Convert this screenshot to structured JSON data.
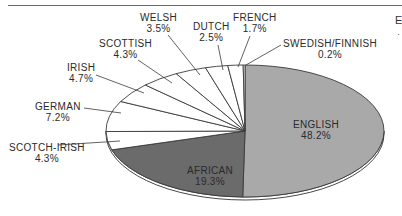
{
  "chart_data": {
    "type": "pie",
    "style": "3d-tilted",
    "title": "",
    "start_angle": "12 o'clock",
    "direction": "clockwise",
    "slices": [
      {
        "label": "ENGLISH",
        "value": 48.2,
        "display": "48.2%",
        "color": "#a9a9a9",
        "label_position": "inside"
      },
      {
        "label": "AFRICAN",
        "value": 19.3,
        "display": "19.3%",
        "color": "#6b6b6b",
        "label_position": "inside"
      },
      {
        "label": "SCOTCH-IRISH",
        "value": 4.3,
        "display": "4.3%",
        "color": "#ffffff",
        "label_position": "outside"
      },
      {
        "label": "GERMAN",
        "value": 7.2,
        "display": "7.2%",
        "color": "#ffffff",
        "label_position": "outside"
      },
      {
        "label": "IRISH",
        "value": 4.7,
        "display": "4.7%",
        "color": "#ffffff",
        "label_position": "outside"
      },
      {
        "label": "SCOTTISH",
        "value": 4.3,
        "display": "4.3%",
        "color": "#ffffff",
        "label_position": "outside"
      },
      {
        "label": "WELSH",
        "value": 3.5,
        "display": "3.5%",
        "color": "#ffffff",
        "label_position": "outside"
      },
      {
        "label": "DUTCH",
        "value": 2.5,
        "display": "2.5%",
        "color": "#ffffff",
        "label_position": "outside"
      },
      {
        "label": "FRENCH",
        "value": 1.7,
        "display": "1.7%",
        "color": "#ffffff",
        "label_position": "outside"
      },
      {
        "label": "SWEDISH/FINNISH",
        "value": 0.2,
        "display": "0.2%",
        "color": "#ffffff",
        "label_position": "outside"
      }
    ],
    "legend": "none (labels on chart)"
  },
  "labels": {
    "english": {
      "name": "ENGLISH",
      "pct": "48.2%"
    },
    "african": {
      "name": "AFRICAN",
      "pct": "19.3%"
    },
    "scotch_irish": {
      "name": "SCOTCH-IRISH",
      "pct": "4.3%"
    },
    "german": {
      "name": "GERMAN",
      "pct": "7.2%"
    },
    "irish": {
      "name": "IRISH",
      "pct": "4.7%"
    },
    "scottish": {
      "name": "SCOTTISH",
      "pct": "4.3%"
    },
    "welsh": {
      "name": "WELSH",
      "pct": "3.5%"
    },
    "dutch": {
      "name": "DUTCH",
      "pct": "2.5%"
    },
    "french": {
      "name": "FRENCH",
      "pct": "1.7%"
    },
    "swedish_finnish": {
      "name": "SWEDISH/FINNISH",
      "pct": "0.2%"
    }
  },
  "edge_fragment": {
    "char": "E",
    "dot": "·"
  }
}
